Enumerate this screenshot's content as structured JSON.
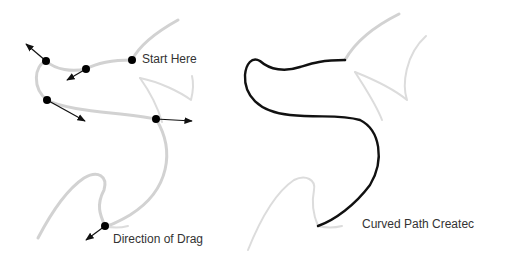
{
  "diagram": {
    "left_panel": {
      "labels": {
        "start": "Start Here",
        "drag": "Direction of Drag"
      },
      "anchor_points": [
        {
          "x": 132,
          "y": 60,
          "note": "start"
        },
        {
          "x": 86,
          "y": 69
        },
        {
          "x": 46,
          "y": 61
        },
        {
          "x": 47,
          "y": 100
        },
        {
          "x": 156,
          "y": 119
        },
        {
          "x": 105,
          "y": 226
        }
      ]
    },
    "right_panel": {
      "labels": {
        "result": "Curved Path Createc"
      }
    },
    "colors": {
      "guide_stroke": "#d2d2d2",
      "path_stroke": "#111111",
      "text": "#333333",
      "background": "#ffffff"
    }
  }
}
